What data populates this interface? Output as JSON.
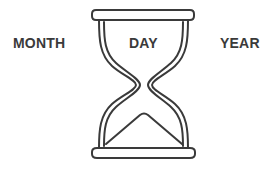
{
  "diagram": {
    "type": "hourglass-time-units",
    "labels": {
      "left": "MONTH",
      "center": "DAY",
      "right": "YEAR"
    },
    "icon": "hourglass-icon",
    "colors": {
      "stroke": "#3a3a3a",
      "text": "#3a3a3a",
      "background": "#ffffff"
    }
  }
}
